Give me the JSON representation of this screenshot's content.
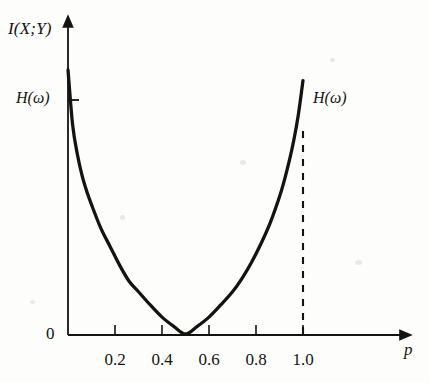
{
  "figure": {
    "background_color": "#fdfdfb",
    "ink_color": "#15130f",
    "y_axis_label": "I(X;Y)",
    "x_axis_label": "p",
    "origin_label": "0",
    "left_annotation": "H(ω)",
    "right_annotation": "H(ω)",
    "x_tick_labels": [
      "0.2",
      "0.4",
      "0.6",
      "0.8",
      "1.0"
    ],
    "x_tick_values": [
      0.2,
      0.4,
      0.6,
      0.8,
      1.0
    ]
  },
  "chart_data": {
    "type": "line",
    "title": "",
    "subtitle": "",
    "xlabel": "p",
    "ylabel": "I(X;Y)",
    "xlim": [
      0,
      1.15
    ],
    "ylim": [
      0,
      1.0
    ],
    "grid": false,
    "legend": null,
    "x_ticks": [
      0.2,
      0.4,
      0.6,
      0.8,
      1.0
    ],
    "x_tick_labels": [
      "0.2",
      "0.4",
      "0.6",
      "0.8",
      "1.0"
    ],
    "y_ticks": [
      0
    ],
    "y_tick_labels": [
      "0"
    ],
    "annotations": [
      {
        "text": "H(ω)",
        "x": 0.0,
        "y": 0.86,
        "position": "left-of-axis",
        "note": "value of I(X;Y) at p = 0"
      },
      {
        "text": "H(ω)",
        "x": 1.0,
        "y": 0.86,
        "position": "right-of-curve",
        "note": "value of I(X;Y) at p = 1"
      }
    ],
    "guides": [
      {
        "type": "vline",
        "x": 1.0,
        "style": "dashed",
        "y_from": 0.0,
        "y_to": 0.78
      }
    ],
    "series": [
      {
        "name": "I(X;Y)",
        "style": "solid",
        "linewidth": 3,
        "color": "#15130f",
        "x": [
          0.0,
          0.02,
          0.04,
          0.06,
          0.08,
          0.1,
          0.14,
          0.18,
          0.22,
          0.26,
          0.3,
          0.35,
          0.4,
          0.45,
          0.5,
          0.55,
          0.6,
          0.65,
          0.7,
          0.74,
          0.78,
          0.82,
          0.86,
          0.9,
          0.92,
          0.94,
          0.96,
          0.98,
          1.0
        ],
        "y": [
          1.0,
          0.79,
          0.68,
          0.6,
          0.54,
          0.49,
          0.4,
          0.33,
          0.26,
          0.2,
          0.16,
          0.11,
          0.064,
          0.029,
          0.0,
          0.029,
          0.064,
          0.11,
          0.16,
          0.21,
          0.27,
          0.34,
          0.42,
          0.52,
          0.58,
          0.65,
          0.73,
          0.83,
          0.96
        ]
      }
    ]
  }
}
